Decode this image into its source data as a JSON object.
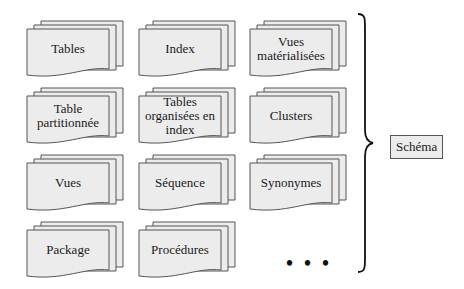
{
  "diagram": {
    "items": [
      {
        "label": "Tables"
      },
      {
        "label": "Index"
      },
      {
        "label": "Vues matérialisées"
      },
      {
        "label": "Table partitionnée"
      },
      {
        "label": "Tables organisées en index"
      },
      {
        "label": "Clusters"
      },
      {
        "label": "Vues"
      },
      {
        "label": "Séquence"
      },
      {
        "label": "Synonymes"
      },
      {
        "label": "Package"
      },
      {
        "label": "Procédures"
      }
    ],
    "ellipsis": "• • •",
    "group_label": "Schéma",
    "colors": {
      "card_fill": "#ececec",
      "card_stroke": "#555555"
    }
  }
}
